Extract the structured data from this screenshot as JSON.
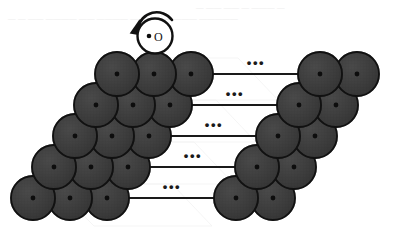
{
  "figure": {
    "background_color": "#ffffff",
    "width": 393,
    "height": 245
  },
  "palette": {
    "sphere_fill": "#3c3c3c",
    "sphere_fill_light": "#4a4a4a",
    "sphere_stroke": "#111111",
    "center_dot": "#0d0d0d",
    "line_color": "#1a1a1a",
    "adatom_fill": "#ffffff",
    "adatom_stroke": "#111111",
    "ghost_artifact": "#ececec"
  },
  "adatom": {
    "name": "adatom",
    "label": "•O",
    "label_text": "O",
    "bullet": "•",
    "cx": 155,
    "cy": 36,
    "r": 17.5,
    "fill": "#ffffff",
    "rotation_arrow": {
      "name": "rotation-arrow",
      "direction": "counter-clockwise",
      "label": "rotation"
    }
  },
  "lattice": {
    "type": "stepped-surface-terrace",
    "rows": 5,
    "left_spheres_per_row": 3,
    "right_spheres_per_row": 2,
    "sphere_radius": 22,
    "row_vertical_pitch": 31,
    "row_horizontal_step": -21,
    "sphere_horizontal_pitch": 37,
    "first_row": {
      "left_start_x": 117,
      "center_y": 74,
      "right_start_x": 320
    },
    "rows_data": [
      {
        "index": 1,
        "left_cx": [
          117,
          154,
          191
        ],
        "right_cx": [
          320,
          357
        ],
        "cy": 74,
        "line": {
          "x1": 191,
          "x2": 320,
          "y": 74
        },
        "ellipsis": {
          "x": 256,
          "y": 67,
          "text": "•••"
        }
      },
      {
        "index": 2,
        "left_cx": [
          96,
          133,
          170
        ],
        "right_cx": [
          299,
          336
        ],
        "cy": 105,
        "line": {
          "x1": 170,
          "x2": 299,
          "y": 105
        },
        "ellipsis": {
          "x": 235,
          "y": 98,
          "text": "•••"
        }
      },
      {
        "index": 3,
        "left_cx": [
          75,
          112,
          149
        ],
        "right_cx": [
          278,
          315
        ],
        "cy": 136,
        "line": {
          "x1": 149,
          "x2": 278,
          "y": 136
        },
        "ellipsis": {
          "x": 214,
          "y": 129,
          "text": "•••"
        }
      },
      {
        "index": 4,
        "left_cx": [
          54,
          91,
          128
        ],
        "right_cx": [
          257,
          294
        ],
        "cy": 167,
        "line": {
          "x1": 128,
          "x2": 257,
          "y": 167
        },
        "ellipsis": {
          "x": 193,
          "y": 160,
          "text": "•••"
        }
      },
      {
        "index": 5,
        "left_cx": [
          33,
          70,
          107
        ],
        "right_cx": [
          236,
          273
        ],
        "cy": 198,
        "line": {
          "x1": 107,
          "x2": 236,
          "y": 198
        },
        "ellipsis": {
          "x": 172,
          "y": 191,
          "text": "•••"
        }
      }
    ],
    "ellipsis_symbol": "•••",
    "ellipsis_count": 5,
    "total_spheres": 25
  },
  "artifacts": {
    "description": "faint scanner bleed-through marks along the top margin",
    "marks": [
      {
        "x": 196,
        "y": 10,
        "text": "— —— —— — ——— —"
      },
      {
        "x": 8,
        "y": 21,
        "text": "—  — ——  ———— —— ———— —— ———  ——— —————"
      }
    ]
  }
}
